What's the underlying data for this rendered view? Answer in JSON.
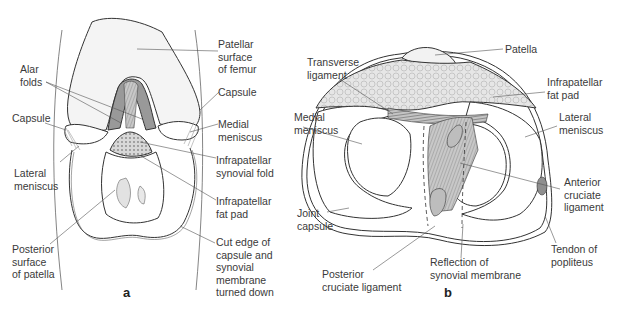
{
  "figure": {
    "panels": [
      {
        "id": "a",
        "letter": "a",
        "labels": {
          "patellar_surface": "Patellar\nsurface\nof femur",
          "alar_folds": "Alar\nfolds",
          "capsule_right": "Capsule",
          "capsule_left": "Capsule",
          "medial_meniscus": "Medial\nmeniscus",
          "lateral_meniscus": "Lateral\nmeniscus",
          "infrapatellar_synovial_fold": "Infrapatellar\nsynovial fold",
          "infrapatellar_fat_pad": "Infrapatellar\nfat pad",
          "posterior_surface_patella": "Posterior\nsurface\nof patella",
          "cut_edge": "Cut edge of\ncapsule and\nsynovial\nmembrane\nturned down"
        }
      },
      {
        "id": "b",
        "letter": "b",
        "labels": {
          "patella": "Patella",
          "transverse_ligament": "Transverse\nligament",
          "infrapatellar_fat_pad": "Infrapatellar\nfat pad",
          "medial_meniscus": "Medial\nmeniscus",
          "lateral_meniscus": "Lateral\nmeniscus",
          "anterior_cruciate": "Anterior\ncruciate\nligament",
          "joint_capsule": "Joint\ncapsule",
          "tendon_popliteus": "Tendon of\npopliteus",
          "reflection_synovial": "Reflection of\nsynovial membrane",
          "posterior_cruciate": "Posterior\ncruciate ligament"
        }
      }
    ],
    "colors": {
      "line": "#333333",
      "shade_dark": "#8f8f8f",
      "shade_mid": "#b5b5b5",
      "shade_light": "#dcdcdc",
      "background": "#ffffff"
    }
  }
}
